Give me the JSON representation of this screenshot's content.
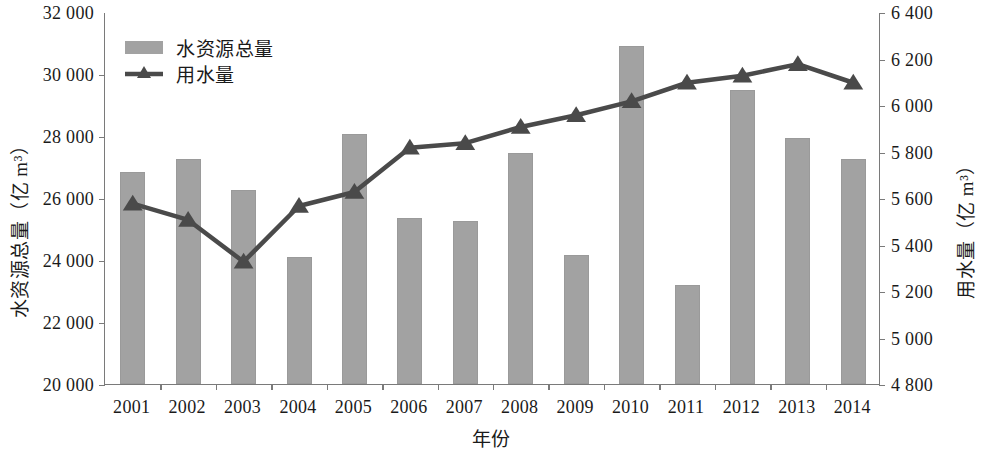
{
  "chart_data": {
    "type": "bar",
    "title": "",
    "xlabel": "年份",
    "categories": [
      "2001",
      "2002",
      "2003",
      "2004",
      "2005",
      "2006",
      "2007",
      "2008",
      "2009",
      "2010",
      "2011",
      "2012",
      "2013",
      "2014"
    ],
    "grid": false,
    "legend_position": "top-left",
    "axes": {
      "left": {
        "label": "水资源总量（亿 m³）",
        "ylim": [
          20000,
          32000
        ],
        "ticks": [
          20000,
          22000,
          24000,
          26000,
          28000,
          30000,
          32000
        ],
        "tick_labels": [
          "20 000",
          "22 000",
          "24 000",
          "26 000",
          "28 000",
          "30 000",
          "32 000"
        ]
      },
      "right": {
        "label": "用水量（亿 m³）",
        "ylim": [
          4800,
          6400
        ],
        "ticks": [
          4800,
          5000,
          5200,
          5400,
          5600,
          5800,
          6000,
          6200,
          6400
        ],
        "tick_labels": [
          "4 800",
          "5 000",
          "5 200",
          "5 400",
          "5 600",
          "5 800",
          "6 000",
          "6 200",
          "6 400"
        ]
      }
    },
    "series": [
      {
        "name": "水资源总量",
        "type": "bar",
        "axis": "left",
        "color": "#a2a2a2",
        "values": [
          26850,
          27250,
          26250,
          24100,
          28050,
          25350,
          25250,
          27450,
          24150,
          30900,
          23200,
          29500,
          27950,
          27250
        ]
      },
      {
        "name": "用水量",
        "type": "line",
        "axis": "right",
        "color": "#4a4a4a",
        "marker": "triangle",
        "values": [
          5580,
          5510,
          5330,
          5570,
          5630,
          5820,
          5840,
          5910,
          5960,
          6020,
          6100,
          6130,
          6180,
          6100
        ]
      }
    ]
  },
  "legend": {
    "items": [
      {
        "label": "水资源总量",
        "marker": "bar-swatch"
      },
      {
        "label": "用水量",
        "marker": "line-triangle-swatch"
      }
    ]
  }
}
